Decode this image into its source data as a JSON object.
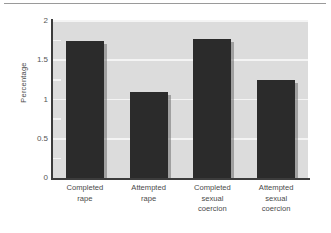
{
  "chart_data": {
    "type": "bar",
    "title": "",
    "subtitle": "",
    "xlabel": "",
    "ylabel": "Percentage",
    "ylim": [
      0,
      2
    ],
    "yticks": [
      0,
      0.5,
      1,
      1.5,
      2
    ],
    "ytick_labels": [
      "0",
      "0.5",
      "1",
      "1.5",
      "2"
    ],
    "minor_ticks": [
      0.25,
      0.75,
      1.25,
      1.75
    ],
    "grid": true,
    "grid_axis": "y",
    "legend": false,
    "legend_position": "none",
    "categories": [
      "Completed rape",
      "Attempted rape",
      "Completed sexual coercion",
      "Attempted sexual coercion"
    ],
    "category_lines": [
      [
        "Completed",
        "rape"
      ],
      [
        "Attempted",
        "rape"
      ],
      [
        "Completed",
        "sexual",
        "coercion"
      ],
      [
        "Attempted",
        "sexual",
        "coercion"
      ]
    ],
    "values": [
      1.75,
      1.1,
      1.77,
      1.25
    ],
    "bar_color": "#2b2b2b",
    "plot_background": "#dcdcdc",
    "gridline_color": "#f4f4f4",
    "axis_color": "#3c3c3c",
    "figure_background": "#ffffff"
  }
}
